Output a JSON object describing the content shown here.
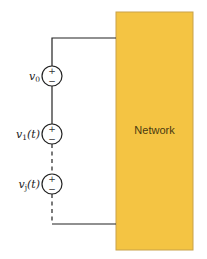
{
  "network": {
    "label": "Network",
    "fill_color": "#F4C443",
    "border_color": "#C9A24A"
  },
  "sources": [
    {
      "var": "v",
      "sub": "0",
      "arg": "",
      "plus": "+",
      "minus": "−"
    },
    {
      "var": "v",
      "sub": "1",
      "arg": "(t)",
      "plus": "+",
      "minus": "−"
    },
    {
      "var": "v",
      "sub": "j",
      "arg": "(t)",
      "plus": "+",
      "minus": "−"
    }
  ],
  "wire_color": "#222222"
}
